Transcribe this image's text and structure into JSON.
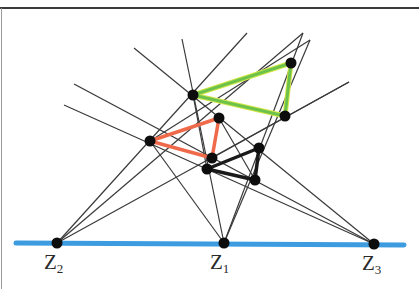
{
  "figure": {
    "colors": {
      "axis_line": "#3d9be0",
      "green_triangle": "#6cc24a",
      "green_triangle_highlight": "#d6e84a",
      "orange_triangle": "#ee6a4a",
      "black_triangle": "#1a1a1a",
      "construction_lines": "#3a3a3a",
      "points": "#0d0d0d"
    },
    "labels": {
      "z1": {
        "main": "Z",
        "sub": "1"
      },
      "z2": {
        "main": "Z",
        "sub": "2"
      },
      "z3": {
        "main": "Z",
        "sub": "3"
      }
    },
    "centers": {
      "Z2": [
        57,
        243
      ],
      "Z1": [
        224,
        243
      ],
      "Z3": [
        374,
        244
      ]
    },
    "triangles": {
      "green": [
        [
          193,
          95
        ],
        [
          291,
          63
        ],
        [
          285,
          116
        ]
      ],
      "orange": [
        [
          219,
          118
        ],
        [
          150,
          141
        ],
        [
          212,
          158
        ]
      ],
      "black": [
        [
          207,
          169
        ],
        [
          259,
          148
        ],
        [
          255,
          180
        ]
      ]
    },
    "axis": {
      "x1": 16,
      "y1": 243,
      "x2": 404,
      "y2": 245
    }
  }
}
